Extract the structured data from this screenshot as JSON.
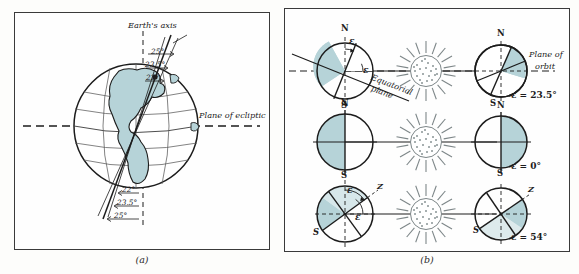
{
  "figure": {
    "panels": [
      {
        "id": "a",
        "caption": "(a)",
        "title_label": "Earth's axis",
        "plane_label": "Plane of ecliptic",
        "top_angles": [
          "25°",
          "23.5°",
          "22°"
        ],
        "bottom_angles": [
          "22°",
          "23.5°",
          "25°"
        ]
      },
      {
        "id": "b",
        "caption": "(b)",
        "plane_label_line1": "Plane of",
        "plane_label_line2": "orbit",
        "equatorial_label_line1": "Equatorial",
        "equatorial_label_line2": "plane",
        "epsilon_symbol": "ε",
        "axis_z_label": "Z",
        "north_label": "N",
        "south_label": "S",
        "rows": [
          {
            "obliquity": "ε = 23.5°",
            "tilt_deg": 23.5
          },
          {
            "obliquity": "ε = 0°",
            "tilt_deg": 0
          },
          {
            "obliquity": "ε = 54°",
            "tilt_deg": 54
          }
        ]
      }
    ]
  },
  "colors": {
    "ocean_fill": "#b6d3d8",
    "line": "#1c1c1c",
    "border": "#3a3a3a",
    "background": "#fdfdfb",
    "sun_stipple": "#8a9496"
  }
}
